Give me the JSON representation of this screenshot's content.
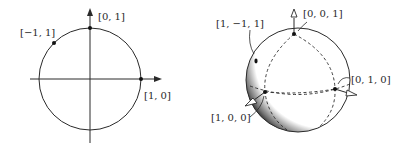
{
  "left_figure": {
    "title": "circle",
    "labels": {
      "top": "[0, 1]",
      "right": "[1, 0]",
      "upper_left": "[−1, 1]"
    }
  },
  "right_figure": {
    "title": "sphere",
    "labels": {
      "top": "[0, 0, 1]",
      "upper_left": "[1, −1, 1]",
      "right": "[0, 1, 0]",
      "lower_left": "[1, 0, 0]"
    }
  },
  "colors": {
    "ink": "#2a2a2a",
    "background": "#ffffff"
  }
}
